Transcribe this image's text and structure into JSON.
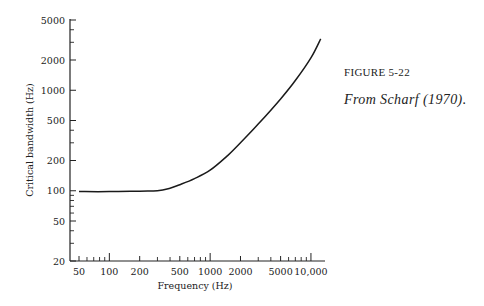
{
  "figure": {
    "label": "FIGURE 5-22",
    "source": "From Scharf (1970)."
  },
  "chart_data": {
    "type": "line",
    "title": "",
    "xlabel": "Frequency (Hz)",
    "ylabel": "Critical bandwidth (Hz)",
    "xscale": "log",
    "yscale": "log",
    "xlim": [
      50,
      12500
    ],
    "ylim": [
      20,
      5000
    ],
    "grid": false,
    "legend": null,
    "x_ticks": [
      50,
      100,
      200,
      500,
      1000,
      2000,
      5000,
      10000
    ],
    "x_tick_labels": [
      "50",
      "100",
      "200",
      "500",
      "1000",
      "2000",
      "5000",
      "10,000"
    ],
    "y_ticks": [
      20,
      50,
      100,
      200,
      500,
      1000,
      2000,
      5000
    ],
    "y_tick_labels": [
      "20",
      "50",
      "100",
      "200",
      "500",
      "1000",
      "2000",
      "5000"
    ],
    "series": [
      {
        "name": "Critical bandwidth",
        "x": [
          50,
          100,
          200,
          300,
          400,
          500,
          700,
          1000,
          1500,
          2000,
          3000,
          5000,
          7000,
          10000,
          12500
        ],
        "y": [
          98,
          98,
          99,
          100,
          106,
          115,
          132,
          160,
          225,
          300,
          460,
          820,
          1250,
          2100,
          3250
        ]
      }
    ]
  }
}
